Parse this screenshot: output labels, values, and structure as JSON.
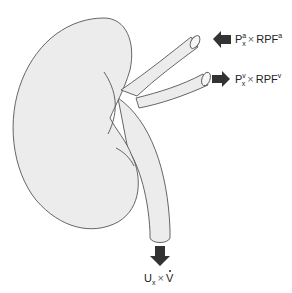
{
  "diagram": {
    "colors": {
      "organ_fill": "#ececec",
      "outline": "#555555",
      "arrow": "#333333",
      "background": "#ffffff"
    },
    "structures": [
      {
        "name": "kidney"
      },
      {
        "name": "renal artery"
      },
      {
        "name": "renal vein"
      },
      {
        "name": "ureter"
      }
    ],
    "labels": {
      "artery": {
        "arrow_direction": "left (into kidney)",
        "P": "P",
        "P_sub": "x",
        "P_sup": "a",
        "times": "×",
        "RPF": "RPF",
        "RPF_sup": "a"
      },
      "vein": {
        "arrow_direction": "right (out of kidney)",
        "P": "P",
        "P_sub": "x",
        "P_sup": "v",
        "times": "×",
        "RPF": "RPF",
        "RPF_sup": "v"
      },
      "urine": {
        "arrow_direction": "down (out of ureter)",
        "U": "U",
        "U_sub": "x",
        "times": "×",
        "V": "V"
      }
    }
  }
}
